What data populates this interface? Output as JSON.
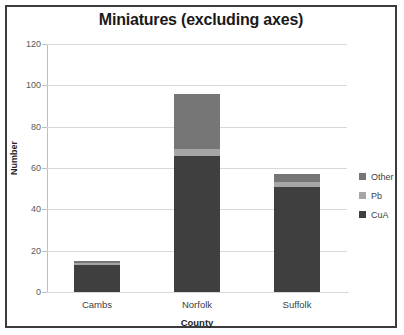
{
  "chart_data": {
    "type": "bar",
    "subtype": "stacked-vertical",
    "title": "Miniatures (excluding axes)",
    "xlabel": "County",
    "ylabel": "Number",
    "categories": [
      "Cambs",
      "Norfolk",
      "Suffolk"
    ],
    "series": [
      {
        "name": "CuA",
        "values": [
          13,
          66,
          51
        ],
        "color": "#3f3f3f"
      },
      {
        "name": "Pb",
        "values": [
          1,
          3,
          2
        ],
        "color": "#a6a6a6"
      },
      {
        "name": "Other",
        "values": [
          1,
          27,
          4
        ],
        "color": "#767676"
      }
    ],
    "totals": [
      15,
      96,
      57
    ],
    "ylim": [
      0,
      120
    ],
    "yticks": [
      0,
      20,
      40,
      60,
      80,
      100,
      120
    ],
    "ytick_labels": [
      "0",
      "20",
      "40",
      "60",
      "80",
      "100",
      "120"
    ],
    "grid": true,
    "legend_position": "right",
    "legend_order": [
      "Other",
      "Pb",
      "CuA"
    ],
    "plot_background": "#ffffff",
    "gridline_color": "#d9d9d9",
    "border_color": "#3c3c3c"
  }
}
